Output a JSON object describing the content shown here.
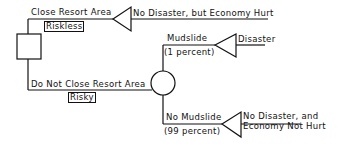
{
  "diagram": {
    "type": "decision-tree",
    "decision_node": {
      "shape": "square"
    },
    "chance_node": {
      "shape": "circle"
    },
    "branches": {
      "close": {
        "label": "Close Resort Area",
        "tag": "Riskless"
      },
      "not_close": {
        "label": "Do Not Close Resort Area",
        "tag": "Risky"
      },
      "mudslide": {
        "label": "Mudslide",
        "probability": "(1 percent)"
      },
      "no_mudslide": {
        "label": "No Mudslide",
        "probability": "(99 percent)"
      }
    },
    "outcomes": {
      "close": "No Disaster, but Economy Hurt",
      "mudslide": "Disaster",
      "no_mudslide_line1": "No Disaster, and",
      "no_mudslide_line2": "Economy Not Hurt"
    },
    "colors": {
      "ink": "#111111",
      "background": "#ffffff"
    }
  }
}
